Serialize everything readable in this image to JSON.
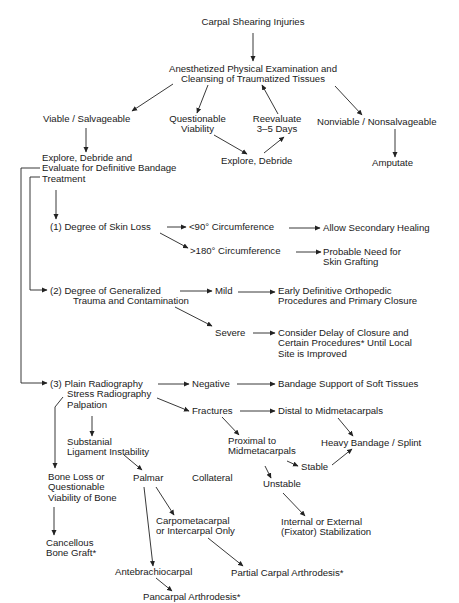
{
  "diagram": {
    "title": "Carpal Shearing Injuries",
    "nodes": {
      "root": {
        "lines": [
          "Carpal Shearing Injuries"
        ]
      },
      "exam": {
        "lines": [
          "Anesthetized Physical Examination and",
          "Cleansing of Traumatized Tissues"
        ]
      },
      "viable": {
        "lines": [
          "Viable / Salvageable"
        ]
      },
      "questionable": {
        "lines": [
          "Questionable",
          "Viability"
        ]
      },
      "reevaluate": {
        "lines": [
          "Reevaluate",
          "3–5 Days"
        ]
      },
      "nonviable": {
        "lines": [
          "Nonviable / Nonsalvageable"
        ]
      },
      "explore_eval": {
        "lines": [
          "Explore, Debride and",
          "Evaluate for Definitive Bandage",
          "Treatment"
        ]
      },
      "explore_debride": {
        "lines": [
          "Explore, Debride"
        ]
      },
      "amputate": {
        "lines": [
          "Amputate"
        ]
      },
      "skin_loss": {
        "lines": [
          "(1)  Degree of Skin Loss"
        ]
      },
      "lt90": {
        "lines": [
          "<90° Circumference"
        ]
      },
      "secondary_healing": {
        "lines": [
          "Allow Secondary Healing"
        ]
      },
      "gt180": {
        "lines": [
          ">180° Circumference"
        ]
      },
      "skin_graft": {
        "lines": [
          "Probable Need for",
          "Skin Grafting"
        ]
      },
      "trauma": {
        "lines": [
          "(2)  Degree of Generalized",
          "Trauma and Contamination"
        ]
      },
      "mild": {
        "lines": [
          "Mild"
        ]
      },
      "early_definitive": {
        "lines": [
          "Early Definitive Orthopedic",
          "Procedures and Primary Closure"
        ]
      },
      "severe": {
        "lines": [
          "Severe"
        ]
      },
      "delay_closure": {
        "lines": [
          "Consider Delay of Closure and",
          "Certain Procedures* Until Local",
          "Site is Improved"
        ]
      },
      "radiography": {
        "lines": [
          "(3)  Plain Radiography",
          "Stress Radiography",
          "Palpation"
        ]
      },
      "negative": {
        "lines": [
          "Negative"
        ]
      },
      "bandage_support": {
        "lines": [
          "Bandage Support of Soft Tissues"
        ]
      },
      "fractures": {
        "lines": [
          "Fractures"
        ]
      },
      "distal": {
        "lines": [
          "Distal to Midmetacarpals"
        ]
      },
      "heavy_bandage": {
        "lines": [
          "Heavy Bandage / Splint"
        ]
      },
      "proximal": {
        "lines": [
          "Proximal to",
          "Midmetacarpals"
        ]
      },
      "stable": {
        "lines": [
          "Stable"
        ]
      },
      "unstable": {
        "lines": [
          "Unstable"
        ]
      },
      "fixator": {
        "lines": [
          "Internal or External",
          "(Fixator) Stabilization"
        ]
      },
      "ligament": {
        "lines": [
          "Substanial",
          "Ligament Instability"
        ]
      },
      "palmar": {
        "lines": [
          "Palmar"
        ]
      },
      "collateral": {
        "lines": [
          "Collateral"
        ]
      },
      "bone_loss": {
        "lines": [
          "Bone Loss or",
          "Questionable",
          "Viability of Bone"
        ]
      },
      "cancellous": {
        "lines": [
          "Cancellous",
          "Bone Graft*"
        ]
      },
      "carpometacarpal": {
        "lines": [
          "Carpometacarpal",
          "or Intercarpal Only"
        ]
      },
      "antebrachiocarpal": {
        "lines": [
          "Antebrachiocarpal"
        ]
      },
      "partial_arthrodesis": {
        "lines": [
          "Partial Carpal Arthrodesis*"
        ]
      },
      "pancarpal_arthrodesis": {
        "lines": [
          "Pancarpal Arthrodesis*"
        ]
      }
    },
    "edges": [
      [
        "root",
        "exam"
      ],
      [
        "exam",
        "viable"
      ],
      [
        "exam",
        "questionable"
      ],
      [
        "reevaluate",
        "exam"
      ],
      [
        "exam",
        "nonviable"
      ],
      [
        "viable",
        "explore_eval"
      ],
      [
        "questionable",
        "explore_debride"
      ],
      [
        "explore_debride",
        "reevaluate"
      ],
      [
        "nonviable",
        "amputate"
      ],
      [
        "explore_eval",
        "skin_loss"
      ],
      [
        "explore_eval",
        "trauma"
      ],
      [
        "explore_eval",
        "radiography"
      ],
      [
        "skin_loss",
        "lt90"
      ],
      [
        "skin_loss",
        "gt180"
      ],
      [
        "lt90",
        "secondary_healing"
      ],
      [
        "gt180",
        "skin_graft"
      ],
      [
        "trauma",
        "mild"
      ],
      [
        "trauma",
        "severe"
      ],
      [
        "mild",
        "early_definitive"
      ],
      [
        "severe",
        "delay_closure"
      ],
      [
        "radiography",
        "negative"
      ],
      [
        "radiography",
        "fractures"
      ],
      [
        "radiography",
        "ligament"
      ],
      [
        "radiography",
        "bone_loss"
      ],
      [
        "negative",
        "bandage_support"
      ],
      [
        "fractures",
        "distal"
      ],
      [
        "fractures",
        "proximal"
      ],
      [
        "distal",
        "heavy_bandage"
      ],
      [
        "proximal",
        "stable"
      ],
      [
        "proximal",
        "unstable"
      ],
      [
        "stable",
        "heavy_bandage"
      ],
      [
        "unstable",
        "fixator"
      ],
      [
        "ligament",
        "palmar"
      ],
      [
        "palmar",
        "carpometacarpal"
      ],
      [
        "palmar",
        "antebrachiocarpal"
      ],
      [
        "carpometacarpal",
        "partial_arthrodesis"
      ],
      [
        "antebrachiocarpal",
        "pancarpal_arthrodesis"
      ],
      [
        "bone_loss",
        "cancellous"
      ]
    ]
  }
}
